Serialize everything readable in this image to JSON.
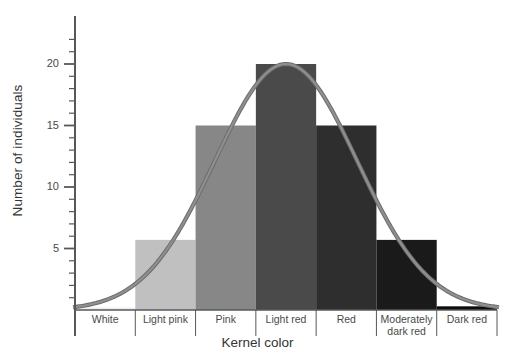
{
  "chart_data": {
    "type": "bar",
    "title": "",
    "xlabel": "Kernel color",
    "ylabel": "Number of individuals",
    "categories": [
      "White",
      "Light pink",
      "Pink",
      "Light red",
      "Red",
      "Moderately dark red",
      "Dark red"
    ],
    "values": [
      0.2,
      5.7,
      15,
      20,
      15,
      5.7,
      0.3
    ],
    "bar_colors": [
      "#ededed",
      "#c0c0c0",
      "#878787",
      "#4a4a4a",
      "#2e2e2e",
      "#1a1a1a",
      "#0d0d0d"
    ],
    "ylim": [
      0,
      22
    ],
    "y_major_ticks": [
      5,
      10,
      15,
      20
    ],
    "y_tick_labels": [
      "5",
      "10",
      "15",
      "20"
    ],
    "y_minor_tick_interval": 1,
    "grid": false,
    "legend": null,
    "overlay": {
      "type": "line",
      "name": "normal distribution curve",
      "color": "#8f8f8f",
      "outline_color": "#6d6d6d",
      "peak_value": 20,
      "peak_category": "Light red",
      "mean_index": 3,
      "sigma_index": 1.18
    },
    "annotations": []
  },
  "axis": {
    "y_axis_name": "y-axis",
    "x_axis_name": "x-axis"
  }
}
